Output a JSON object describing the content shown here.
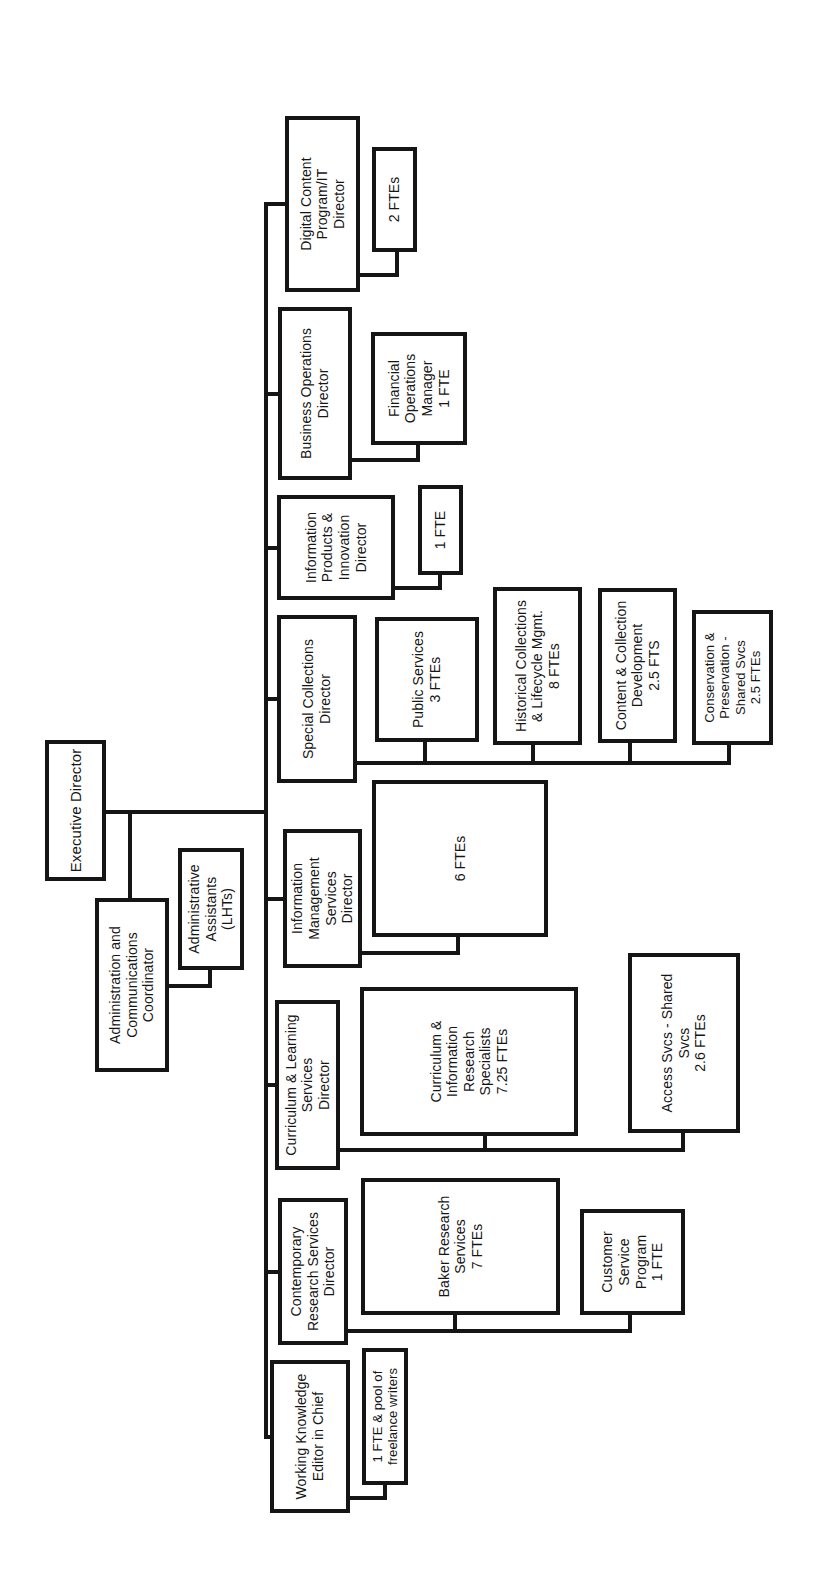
{
  "colors": {
    "line": "#151515",
    "text": "#151515",
    "background": "#ffffff"
  },
  "nodes": {
    "executive_director": {
      "label": "Executive Director"
    },
    "admin_coordinator": {
      "label": "Administration and\nCommunications\nCoordinator"
    },
    "admin_assistants": {
      "label": "Administrative\nAssistants\n(LHTs)"
    },
    "working_knowledge": {
      "label": "Working Knowledge\nEditor in Chief"
    },
    "contemporary_research": {
      "label": "Contemporary\nResearch Services\nDirector"
    },
    "curriculum_learning": {
      "label": "Curriculum & Learning\nServices\nDirector"
    },
    "info_mgmt": {
      "label": "Information\nManagement\nServices\nDirector"
    },
    "special_collections": {
      "label": "Special Collections\nDirector"
    },
    "info_products": {
      "label": "Information\nProducts &\nInnovation\nDirector"
    },
    "business_ops": {
      "label": "Business Operations\nDirector"
    },
    "digital_content": {
      "label": "Digital Content\nProgram/IT\nDirector"
    },
    "freelance_pool": {
      "label": "1 FTE & pool of\nfreelance writers"
    },
    "baker_research": {
      "label": "Baker Research\nServices\n7 FTEs"
    },
    "customer_service": {
      "label": "Customer\nService\nProgram\n1 FTE"
    },
    "curriculum_specialists": {
      "label": "Curriculum &\nInformation\nResearch\nSpecialists\n7.25 FTEs"
    },
    "access_svcs": {
      "label": "Access Svcs - Shared\nSvcs\n2.6 FTEs"
    },
    "six_ftes": {
      "label": "6 FTEs"
    },
    "public_services": {
      "label": "Public Services\n3 FTEs"
    },
    "historical_collections": {
      "label": "Historical Collections\n& Lifecycle  Mgmt.\n8 FTEs"
    },
    "content_collection": {
      "label": "Content & Collection\nDevelopment\n2.5 FTS"
    },
    "conservation": {
      "label": "Conservation &\nPreservation -\nShared Svcs\n2.5 FTEs"
    },
    "one_fte": {
      "label": "1 FTE"
    },
    "financial_ops": {
      "label": "Financial\nOperations\nManager\n1 FTE"
    },
    "two_ftes": {
      "label": "2 FTEs"
    }
  }
}
